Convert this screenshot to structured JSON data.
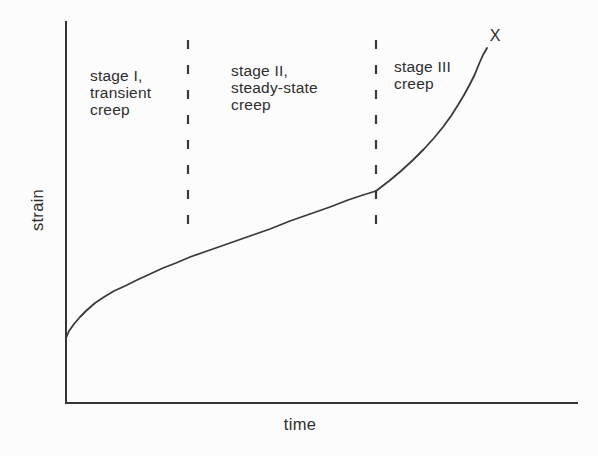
{
  "colors": {
    "ink": "#2e2e2e",
    "line": "#3a3a3a",
    "background": "#fcfcfc"
  },
  "figure": {
    "ylabel": "strain",
    "xlabel": "time",
    "failure_marker": "X",
    "stages": [
      {
        "label": "stage I,\ntransient\ncreep"
      },
      {
        "label": "stage II,\nsteady-state\ncreep"
      },
      {
        "label": "stage III\ncreep"
      }
    ]
  },
  "chart_data": {
    "type": "line",
    "title": "",
    "xlabel": "time",
    "ylabel": "strain",
    "axes_numeric": false,
    "x_tick_labels": [],
    "y_tick_labels": [],
    "grid": false,
    "legend": null,
    "annotations": [
      {
        "text": "stage I,\ntransient\ncreep",
        "region": "between y-axis and first dashed boundary"
      },
      {
        "text": "stage II,\nsteady-state\ncreep",
        "region": "between the two dashed boundaries"
      },
      {
        "text": "stage III\ncreep",
        "region": "right of second dashed boundary"
      },
      {
        "text": "X",
        "meaning": "rupture point at upper end of curve"
      }
    ],
    "plot_box_px": {
      "x_axis_y": 403,
      "y_axis_x": 66,
      "x_end": 577,
      "y_top": 22
    },
    "stage_boundaries_px": [
      188,
      376
    ],
    "stage_boundary_dash_y_px": [
      40,
      232
    ],
    "series": [
      {
        "name": "creep curve (strain vs time, schematic — no numeric scale)",
        "starts_at_nonzero_strain": true,
        "points_px": [
          [
            66,
            338
          ],
          [
            69,
            331
          ],
          [
            74,
            324
          ],
          [
            80,
            317
          ],
          [
            87,
            310
          ],
          [
            95,
            303
          ],
          [
            104,
            297
          ],
          [
            114,
            291
          ],
          [
            125,
            286
          ],
          [
            137,
            280
          ],
          [
            150,
            274
          ],
          [
            163,
            268
          ],
          [
            176,
            263
          ],
          [
            190,
            257
          ],
          [
            210,
            250
          ],
          [
            230,
            243
          ],
          [
            250,
            236
          ],
          [
            270,
            229
          ],
          [
            290,
            221
          ],
          [
            310,
            214
          ],
          [
            330,
            207
          ],
          [
            348,
            200
          ],
          [
            363,
            195
          ],
          [
            376,
            191
          ],
          [
            389,
            181
          ],
          [
            401,
            171
          ],
          [
            413,
            160
          ],
          [
            424,
            149
          ],
          [
            434,
            138
          ],
          [
            443,
            127
          ],
          [
            451,
            116
          ],
          [
            458,
            105
          ],
          [
            464,
            95
          ],
          [
            470,
            84
          ],
          [
            475,
            74
          ],
          [
            479,
            64
          ],
          [
            483,
            55
          ],
          [
            487,
            48
          ]
        ],
        "key_points_norm_x0to1_y0to1": {
          "start": [
            0.0,
            0.17
          ],
          "end_of_stage_I": [
            0.24,
            0.38
          ],
          "end_of_stage_II": [
            0.61,
            0.56
          ],
          "rupture": [
            0.82,
            0.93
          ]
        }
      }
    ]
  }
}
